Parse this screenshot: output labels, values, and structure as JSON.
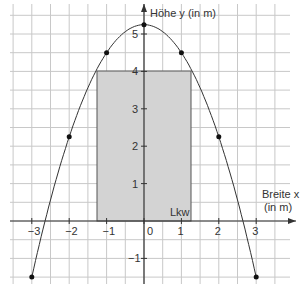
{
  "axes": {
    "y_label": "Höhe y (in m)",
    "x_label_line1": "Breite x",
    "x_label_line2": "(in m)",
    "x_ticks": [
      "−3",
      "−2",
      "−1",
      "0",
      "1",
      "2",
      "3"
    ],
    "y_ticks": [
      "−1",
      "1",
      "2",
      "3",
      "4",
      "5"
    ]
  },
  "truck_label": "Lkw",
  "colors": {
    "grid": "#c8c8c8",
    "truck_fill": "#d3d3d3",
    "curve": "#333333",
    "axis": "#333333"
  },
  "chart_data": {
    "type": "scatter",
    "title": "",
    "xlabel": "Breite x (in m)",
    "ylabel": "Höhe y (in m)",
    "xlim": [
      -3.5,
      3.75
    ],
    "ylim": [
      -1.5,
      5.5
    ],
    "grid": true,
    "curve": "parabola y = 5.25 - 0.75x²",
    "points": [
      {
        "x": -3,
        "y": -1.5
      },
      {
        "x": -2,
        "y": 2.25
      },
      {
        "x": -1,
        "y": 4.5
      },
      {
        "x": 0,
        "y": 5.25
      },
      {
        "x": 1,
        "y": 4.5
      },
      {
        "x": 2,
        "y": 2.25
      },
      {
        "x": 3,
        "y": -1.5
      }
    ],
    "rectangle": {
      "label": "Lkw",
      "x_from": -1.25,
      "x_to": 1.25,
      "y_from": 0,
      "y_to": 4
    }
  }
}
